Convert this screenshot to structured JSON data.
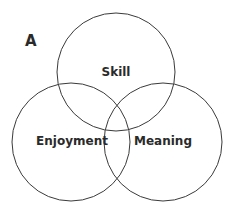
{
  "diagram": {
    "type": "venn",
    "panel_label": "A",
    "sets": [
      {
        "id": "skill",
        "label": "Skill",
        "cx": 116,
        "cy": 72,
        "r": 59
      },
      {
        "id": "enjoyment",
        "label": "Enjoyment",
        "cx": 71,
        "cy": 142,
        "r": 59
      },
      {
        "id": "meaning",
        "label": "Meaning",
        "cx": 163,
        "cy": 142,
        "r": 59
      }
    ]
  }
}
